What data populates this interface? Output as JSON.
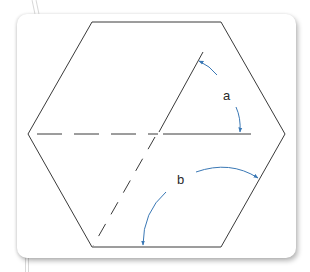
{
  "diagram": {
    "type": "geometry-hexagon-angles",
    "labels": {
      "angle_a": "a",
      "angle_b": "b"
    },
    "colors": {
      "line": "#3a3a3a",
      "arrow": "#3a78b5",
      "card_background": "#ffffff"
    },
    "shapes": {
      "hexagon": "regular hexagon with horizontal top and bottom edges",
      "horizontal_line": "dashed left half, solid right half through center",
      "diagonal_line": "solid upper-right half, dashed lower-left half through center"
    }
  }
}
